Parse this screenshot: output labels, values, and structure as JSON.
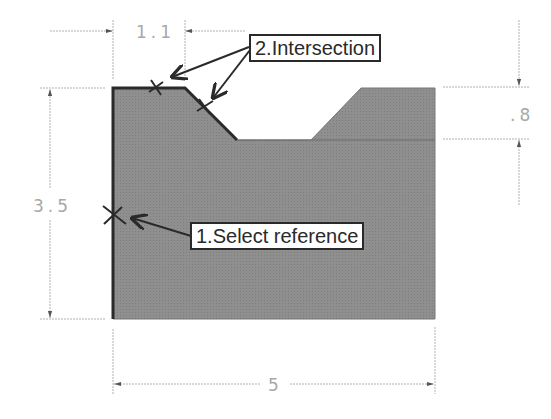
{
  "diagram": {
    "type": "sketch-dimensioned-profile",
    "colors": {
      "fill": "#8c8c8c",
      "outline": "#2a2a2a",
      "dimension": "#a8a8a8",
      "label_border": "#2a2a2a",
      "background": "#ffffff"
    },
    "dimensions": {
      "height": "3.5",
      "width": "5",
      "groove_depth": ".8",
      "top_flat": "1.1"
    },
    "callouts": [
      {
        "step": 1,
        "label": "1.Select reference"
      },
      {
        "step": 2,
        "label": "2.Intersection"
      }
    ],
    "markers": [
      {
        "name": "reference-point",
        "symbol": "×"
      },
      {
        "name": "intersection-point-1",
        "symbol": "×"
      },
      {
        "name": "intersection-point-2",
        "symbol": "×"
      }
    ]
  }
}
